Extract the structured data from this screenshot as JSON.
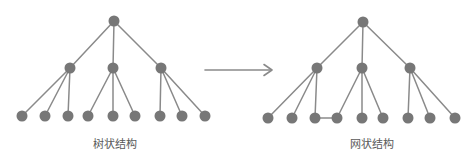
{
  "page": {
    "background": "#ffffff"
  },
  "style": {
    "node_color": "#777777",
    "edge_color": "#8a8a8a",
    "label_color": "#595959",
    "node_radius": 5.5,
    "edge_width": 1.5
  },
  "arrow": {
    "name": "right-arrow",
    "color": "#8a8a8a",
    "x1": 205,
    "y1": 70,
    "x2": 272,
    "y2": 70,
    "head_size": 8
  },
  "diagrams": {
    "tree": {
      "label": "树状结构",
      "label_pos": [
        115,
        148
      ],
      "nodes": [
        [
          114,
          21
        ],
        [
          70,
          68
        ],
        [
          113,
          68
        ],
        [
          161,
          68
        ],
        [
          22,
          116
        ],
        [
          45,
          116
        ],
        [
          68,
          116
        ],
        [
          88,
          116
        ],
        [
          113,
          116
        ],
        [
          135,
          116
        ],
        [
          160,
          116
        ],
        [
          182,
          116
        ],
        [
          205,
          116
        ]
      ],
      "edges": [
        [
          0,
          1
        ],
        [
          0,
          2
        ],
        [
          0,
          3
        ],
        [
          1,
          4
        ],
        [
          1,
          5
        ],
        [
          1,
          6
        ],
        [
          2,
          7
        ],
        [
          2,
          8
        ],
        [
          2,
          9
        ],
        [
          3,
          10
        ],
        [
          3,
          11
        ],
        [
          3,
          12
        ]
      ]
    },
    "network": {
      "label": "网状结构",
      "label_pos": [
        372,
        148
      ],
      "nodes": [
        [
          363,
          22
        ],
        [
          317,
          68
        ],
        [
          362,
          68
        ],
        [
          410,
          68
        ],
        [
          268,
          118
        ],
        [
          292,
          118
        ],
        [
          315,
          118
        ],
        [
          337,
          118
        ],
        [
          362,
          118
        ],
        [
          383,
          118
        ],
        [
          408,
          118
        ],
        [
          430,
          118
        ],
        [
          455,
          118
        ]
      ],
      "edges": [
        [
          0,
          1
        ],
        [
          0,
          2
        ],
        [
          0,
          3
        ],
        [
          1,
          4
        ],
        [
          1,
          5
        ],
        [
          1,
          6
        ],
        [
          2,
          7
        ],
        [
          2,
          8
        ],
        [
          2,
          9
        ],
        [
          3,
          10
        ],
        [
          3,
          11
        ],
        [
          3,
          12
        ],
        [
          6,
          7
        ]
      ]
    }
  }
}
